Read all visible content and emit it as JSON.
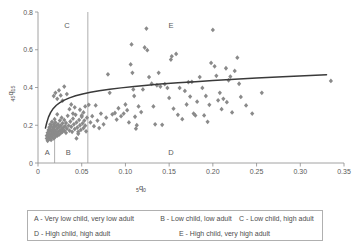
{
  "chart_data": {
    "type": "scatter",
    "title": "",
    "xlabel": "5q0",
    "xlabel_main": "q",
    "xlabel_pre": "5",
    "xlabel_post": "0",
    "ylabel": "45q15",
    "ylabel_pre": "45",
    "ylabel_main": "q",
    "ylabel_post": "15",
    "xlim": [
      0,
      0.35
    ],
    "ylim": [
      0,
      0.8
    ],
    "xticks": [
      "0",
      "0.05",
      "0.10",
      "0.15",
      "0.20",
      "0.25",
      "0.30",
      "0.35"
    ],
    "xtick_values": [
      0,
      0.05,
      0.1,
      0.15,
      0.2,
      0.25,
      0.3,
      0.35
    ],
    "yticks": [
      "0",
      "0.2",
      "0.4",
      "0.6",
      "0.8"
    ],
    "ytick_values": [
      0,
      0.2,
      0.4,
      0.6,
      0.8
    ],
    "grid": false,
    "legend_position": "below-plot",
    "marker_shape": "diamond",
    "marker_color": "#8a8a8a",
    "curve_color": "#3a3a3a",
    "axis_color": "#8c8c8c",
    "divider_lines": [
      {
        "x": 0.019,
        "y_from": 0.0,
        "y_to": 0.22,
        "label": "short-divider-a-b"
      },
      {
        "x": 0.057,
        "y_from": 0.0,
        "y_to": 0.8,
        "label": "full-divider-b-d"
      }
    ],
    "region_labels": [
      {
        "id": "C",
        "x": 0.033,
        "y": 0.715
      },
      {
        "id": "E",
        "x": 0.152,
        "y": 0.715
      },
      {
        "id": "A",
        "x": 0.0105,
        "y": 0.045
      },
      {
        "id": "B",
        "x": 0.0345,
        "y": 0.045
      },
      {
        "id": "D",
        "x": 0.152,
        "y": 0.045
      }
    ],
    "fit_curve": {
      "description": "logarithmic fit of adult mortality on child mortality",
      "points": [
        [
          0.0085,
          0.185
        ],
        [
          0.01,
          0.213
        ],
        [
          0.012,
          0.243
        ],
        [
          0.0145,
          0.268
        ],
        [
          0.0175,
          0.289
        ],
        [
          0.021,
          0.306
        ],
        [
          0.025,
          0.32
        ],
        [
          0.03,
          0.333
        ],
        [
          0.036,
          0.345
        ],
        [
          0.043,
          0.356
        ],
        [
          0.051,
          0.366
        ],
        [
          0.06,
          0.375
        ],
        [
          0.07,
          0.383
        ],
        [
          0.082,
          0.391
        ],
        [
          0.095,
          0.398
        ],
        [
          0.11,
          0.405
        ],
        [
          0.125,
          0.412
        ],
        [
          0.14,
          0.418
        ],
        [
          0.16,
          0.425
        ],
        [
          0.18,
          0.431
        ],
        [
          0.2,
          0.437
        ],
        [
          0.225,
          0.444
        ],
        [
          0.25,
          0.45
        ],
        [
          0.28,
          0.457
        ],
        [
          0.305,
          0.462
        ],
        [
          0.33,
          0.468
        ]
      ]
    },
    "points": [
      [
        0.01,
        0.13
      ],
      [
        0.01,
        0.145
      ],
      [
        0.011,
        0.118
      ],
      [
        0.011,
        0.16
      ],
      [
        0.012,
        0.135
      ],
      [
        0.012,
        0.175
      ],
      [
        0.012,
        0.152
      ],
      [
        0.013,
        0.128
      ],
      [
        0.013,
        0.19
      ],
      [
        0.013,
        0.165
      ],
      [
        0.014,
        0.142
      ],
      [
        0.014,
        0.205
      ],
      [
        0.014,
        0.178
      ],
      [
        0.015,
        0.122
      ],
      [
        0.015,
        0.155
      ],
      [
        0.015,
        0.196
      ],
      [
        0.016,
        0.138
      ],
      [
        0.016,
        0.172
      ],
      [
        0.016,
        0.218
      ],
      [
        0.017,
        0.148
      ],
      [
        0.017,
        0.186
      ],
      [
        0.017,
        0.163
      ],
      [
        0.018,
        0.13
      ],
      [
        0.018,
        0.205
      ],
      [
        0.018,
        0.178
      ],
      [
        0.019,
        0.155
      ],
      [
        0.019,
        0.232
      ],
      [
        0.019,
        0.192
      ],
      [
        0.02,
        0.14
      ],
      [
        0.02,
        0.17
      ],
      [
        0.02,
        0.215
      ],
      [
        0.021,
        0.158
      ],
      [
        0.021,
        0.198
      ],
      [
        0.022,
        0.145
      ],
      [
        0.022,
        0.182
      ],
      [
        0.022,
        0.258
      ],
      [
        0.023,
        0.165
      ],
      [
        0.023,
        0.205
      ],
      [
        0.024,
        0.15
      ],
      [
        0.024,
        0.19
      ],
      [
        0.025,
        0.172
      ],
      [
        0.025,
        0.225
      ],
      [
        0.026,
        0.158
      ],
      [
        0.026,
        0.198
      ],
      [
        0.027,
        0.18
      ],
      [
        0.027,
        0.24
      ],
      [
        0.028,
        0.165
      ],
      [
        0.028,
        0.21
      ],
      [
        0.029,
        0.188
      ],
      [
        0.03,
        0.172
      ],
      [
        0.03,
        0.228
      ],
      [
        0.031,
        0.195
      ],
      [
        0.032,
        0.16
      ],
      [
        0.032,
        0.212
      ],
      [
        0.033,
        0.182
      ],
      [
        0.034,
        0.25
      ],
      [
        0.035,
        0.198
      ],
      [
        0.036,
        0.172
      ],
      [
        0.037,
        0.22
      ],
      [
        0.038,
        0.192
      ],
      [
        0.039,
        0.165
      ],
      [
        0.04,
        0.235
      ],
      [
        0.041,
        0.205
      ],
      [
        0.042,
        0.18
      ],
      [
        0.043,
        0.255
      ],
      [
        0.044,
        0.215
      ],
      [
        0.045,
        0.188
      ],
      [
        0.046,
        0.165
      ],
      [
        0.047,
        0.228
      ],
      [
        0.048,
        0.2
      ],
      [
        0.049,
        0.175
      ],
      [
        0.05,
        0.245
      ],
      [
        0.051,
        0.21
      ],
      [
        0.052,
        0.185
      ],
      [
        0.053,
        0.225
      ],
      [
        0.054,
        0.198
      ],
      [
        0.055,
        0.168
      ],
      [
        0.056,
        0.24
      ],
      [
        0.018,
        0.355
      ],
      [
        0.02,
        0.372
      ],
      [
        0.022,
        0.34
      ],
      [
        0.024,
        0.385
      ],
      [
        0.026,
        0.358
      ],
      [
        0.028,
        0.33
      ],
      [
        0.03,
        0.405
      ],
      [
        0.033,
        0.365
      ],
      [
        0.036,
        0.285
      ],
      [
        0.038,
        0.31
      ],
      [
        0.04,
        0.262
      ],
      [
        0.042,
        0.295
      ],
      [
        0.044,
        0.13
      ],
      [
        0.046,
        0.155
      ],
      [
        0.048,
        0.282
      ],
      [
        0.05,
        0.252
      ],
      [
        0.052,
        0.268
      ],
      [
        0.054,
        0.3
      ],
      [
        0.058,
        0.308
      ],
      [
        0.06,
        0.215
      ],
      [
        0.062,
        0.248
      ],
      [
        0.064,
        0.195
      ],
      [
        0.066,
        0.305
      ],
      [
        0.068,
        0.225
      ],
      [
        0.07,
        0.185
      ],
      [
        0.072,
        0.262
      ],
      [
        0.075,
        0.205
      ],
      [
        0.078,
        0.24
      ],
      [
        0.08,
        0.47
      ],
      [
        0.082,
        0.372
      ],
      [
        0.085,
        0.258
      ],
      [
        0.088,
        0.265
      ],
      [
        0.09,
        0.23
      ],
      [
        0.092,
        0.29
      ],
      [
        0.095,
        0.248
      ],
      [
        0.098,
        0.262
      ],
      [
        0.1,
        0.31
      ],
      [
        0.102,
        0.28
      ],
      [
        0.104,
        0.215
      ],
      [
        0.106,
        0.522
      ],
      [
        0.107,
        0.628
      ],
      [
        0.108,
        0.478
      ],
      [
        0.109,
        0.39
      ],
      [
        0.11,
        0.355
      ],
      [
        0.111,
        0.245
      ],
      [
        0.112,
        0.182
      ],
      [
        0.113,
        0.2
      ],
      [
        0.115,
        0.3
      ],
      [
        0.118,
        0.27
      ],
      [
        0.12,
        0.39
      ],
      [
        0.122,
        0.612
      ],
      [
        0.124,
        0.712
      ],
      [
        0.125,
        0.598
      ],
      [
        0.127,
        0.455
      ],
      [
        0.13,
        0.42
      ],
      [
        0.132,
        0.3
      ],
      [
        0.134,
        0.205
      ],
      [
        0.136,
        0.412
      ],
      [
        0.138,
        0.478
      ],
      [
        0.14,
        0.405
      ],
      [
        0.142,
        0.202
      ],
      [
        0.145,
        0.418
      ],
      [
        0.148,
        0.398
      ],
      [
        0.15,
        0.345
      ],
      [
        0.152,
        0.548
      ],
      [
        0.153,
        0.565
      ],
      [
        0.155,
        0.288
      ],
      [
        0.158,
        0.578
      ],
      [
        0.16,
        0.255
      ],
      [
        0.162,
        0.398
      ],
      [
        0.165,
        0.232
      ],
      [
        0.168,
        0.382
      ],
      [
        0.17,
        0.31
      ],
      [
        0.172,
        0.428
      ],
      [
        0.174,
        0.352
      ],
      [
        0.176,
        0.43
      ],
      [
        0.178,
        0.262
      ],
      [
        0.18,
        0.252
      ],
      [
        0.182,
        0.325
      ],
      [
        0.185,
        0.455
      ],
      [
        0.188,
        0.398
      ],
      [
        0.19,
        0.252
      ],
      [
        0.192,
        0.355
      ],
      [
        0.194,
        0.218
      ],
      [
        0.196,
        0.308
      ],
      [
        0.198,
        0.53
      ],
      [
        0.2,
        0.705
      ],
      [
        0.202,
        0.512
      ],
      [
        0.204,
        0.462
      ],
      [
        0.206,
        0.332
      ],
      [
        0.208,
        0.372
      ],
      [
        0.21,
        0.285
      ],
      [
        0.212,
        0.34
      ],
      [
        0.215,
        0.502
      ],
      [
        0.216,
        0.322
      ],
      [
        0.218,
        0.438
      ],
      [
        0.22,
        0.458
      ],
      [
        0.222,
        0.268
      ],
      [
        0.225,
        0.488
      ],
      [
        0.228,
        0.558
      ],
      [
        0.23,
        0.42
      ],
      [
        0.232,
        0.35
      ],
      [
        0.238,
        0.305
      ],
      [
        0.245,
        0.262
      ],
      [
        0.256,
        0.372
      ],
      [
        0.335,
        0.435
      ]
    ]
  },
  "legend": {
    "entries": [
      "A - Very low child, very low adult",
      "B - Low child, low adult",
      "C - Low child, high adult",
      "D - High child, high adult",
      "E - High child, very high adult"
    ]
  }
}
